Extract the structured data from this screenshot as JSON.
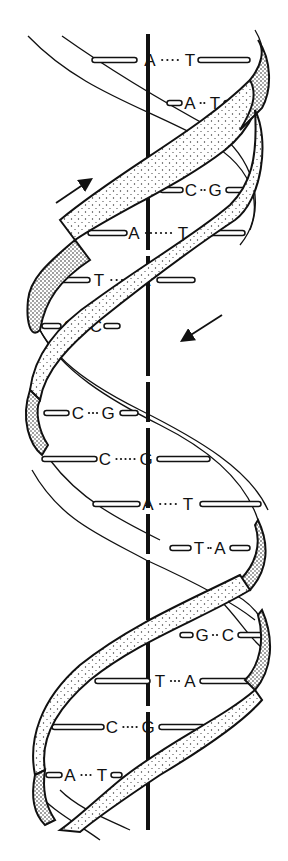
{
  "figure": {
    "colors": {
      "ink": "#111111",
      "paper": "#ffffff",
      "stipple": "#333333"
    },
    "axis": {
      "x": 148,
      "y_top": 34,
      "y_bottom": 830
    },
    "arrows": [
      {
        "name": "strand-direction-up",
        "x1": 56,
        "y1": 203,
        "x2": 90,
        "y2": 180
      },
      {
        "name": "strand-direction-down",
        "x1": 222,
        "y1": 315,
        "x2": 183,
        "y2": 340
      }
    ],
    "base_pairs": [
      {
        "left": "A",
        "right": "T",
        "y": 60,
        "lx": 150,
        "rx": 190,
        "bar_l": [
          92,
          137
        ],
        "bar_r": [
          198,
          250
        ]
      },
      {
        "left": "A",
        "right": "T",
        "y": 103,
        "lx": 190,
        "rx": 215,
        "bar_l": [
          167,
          182
        ],
        "bar_r": [
          224,
          240
        ]
      },
      {
        "left": "C",
        "right": "G",
        "y": 190,
        "lx": 191,
        "rx": 215,
        "bar_l": [
          160,
          183
        ],
        "bar_r": [
          226,
          250
        ]
      },
      {
        "left": "A",
        "right": "T",
        "y": 233,
        "lx": 134,
        "rx": 183,
        "bar_l": [
          88,
          127
        ],
        "bar_r": [
          196,
          245
        ]
      },
      {
        "left": "T",
        "right": "A",
        "y": 280,
        "lx": 99,
        "rx": 145,
        "bar_l": [
          40,
          90
        ],
        "bar_r": [
          157,
          195
        ]
      },
      {
        "left": "G",
        "right": "C",
        "y": 326,
        "lx": 70,
        "rx": 96,
        "bar_l": [
          42,
          61
        ],
        "bar_r": [
          104,
          120
        ]
      },
      {
        "left": "C",
        "right": "G",
        "y": 413,
        "lx": 78,
        "rx": 108,
        "bar_l": [
          44,
          69
        ],
        "bar_r": [
          120,
          138
        ]
      },
      {
        "left": "C",
        "right": "G",
        "y": 459,
        "lx": 105,
        "rx": 146,
        "bar_l": [
          42,
          97
        ],
        "bar_r": [
          157,
          210
        ]
      },
      {
        "left": "A",
        "right": "T",
        "y": 504,
        "lx": 148,
        "rx": 188,
        "bar_l": [
          93,
          140
        ],
        "bar_r": [
          200,
          261
        ]
      },
      {
        "left": "T",
        "right": "A",
        "y": 548,
        "lx": 199,
        "rx": 220,
        "bar_l": [
          170,
          191
        ],
        "bar_r": [
          230,
          250
        ]
      },
      {
        "left": "G",
        "right": "C",
        "y": 635,
        "lx": 202,
        "rx": 228,
        "bar_l": [
          180,
          193
        ],
        "bar_r": [
          238,
          265
        ]
      },
      {
        "left": "T",
        "right": "A",
        "y": 681,
        "lx": 160,
        "rx": 190,
        "bar_l": [
          95,
          150
        ],
        "bar_r": [
          200,
          252
        ]
      },
      {
        "left": "C",
        "right": "G",
        "y": 727,
        "lx": 112,
        "rx": 148,
        "bar_l": [
          52,
          104
        ],
        "bar_r": [
          159,
          205
        ]
      },
      {
        "left": "A",
        "right": "T",
        "y": 775,
        "lx": 70,
        "rx": 102,
        "bar_l": [
          46,
          62
        ],
        "bar_r": [
          111,
          122
        ]
      }
    ]
  }
}
